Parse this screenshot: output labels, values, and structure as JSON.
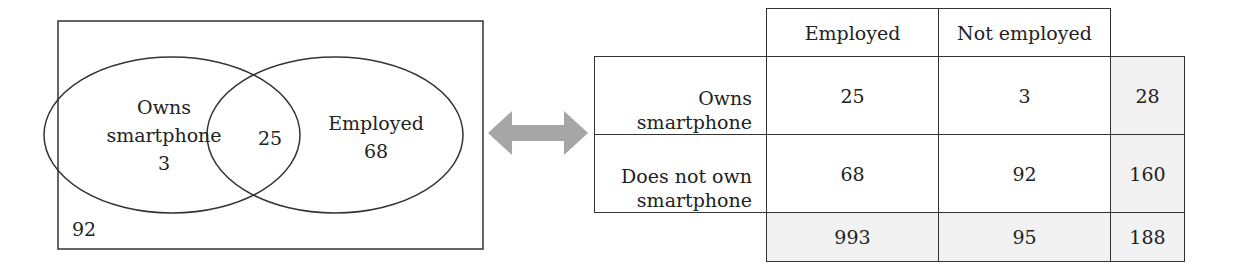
{
  "venn": {
    "left_circle": {
      "label_line1": "Owns",
      "label_line2": "smartphone",
      "value": "3"
    },
    "intersection": {
      "value": "25"
    },
    "right_circle": {
      "label": "Employed",
      "value": "68"
    },
    "outside": {
      "value": "92"
    }
  },
  "arrow": {
    "icon": "double-arrow-icon",
    "color": "#a6a6a6"
  },
  "table": {
    "col_headers": [
      "Employed",
      "Not employed"
    ],
    "rows": [
      {
        "label_line1": "Owns",
        "label_line2": "smartphone",
        "values": [
          "25",
          "3"
        ],
        "total": "28"
      },
      {
        "label_line1": "Does not own",
        "label_line2": "smartphone",
        "values": [
          "68",
          "92"
        ],
        "total": "160"
      }
    ],
    "totals": {
      "values": [
        "993",
        "95"
      ],
      "grand_total": "188"
    },
    "shade_color": "#f1f1f1"
  }
}
